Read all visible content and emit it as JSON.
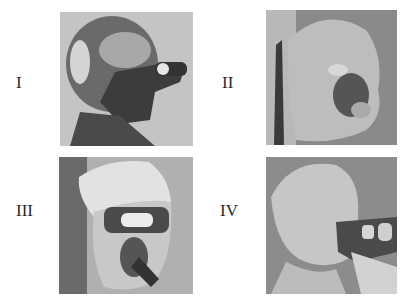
{
  "figure": {
    "panels": [
      {
        "label": "I",
        "description": "Head wearing dark rubber mask with breathing tube, profile view"
      },
      {
        "label": "II",
        "description": "Pale head form in profile with dark mouth/nose region, rod at left"
      },
      {
        "label": "III",
        "description": "Head with light hood, dark eye band and mouthpiece tube"
      },
      {
        "label": "IV",
        "description": "Pale hooded head in profile with dark mask and tube"
      }
    ]
  }
}
